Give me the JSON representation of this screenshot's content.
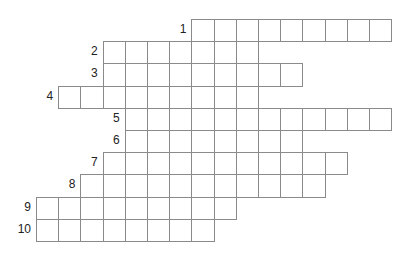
{
  "puzzle": {
    "type": "crossword",
    "cell_size": 22.2,
    "origin_x": 37,
    "origin_y": 20,
    "rows": [
      {
        "number": "1",
        "start_col": 7,
        "length": 9
      },
      {
        "number": "2",
        "start_col": 3,
        "length": 7
      },
      {
        "number": "3",
        "start_col": 3,
        "length": 9
      },
      {
        "number": "4",
        "start_col": 1,
        "length": 9
      },
      {
        "number": "5",
        "start_col": 4,
        "length": 12
      },
      {
        "number": "6",
        "start_col": 4,
        "length": 8
      },
      {
        "number": "7",
        "start_col": 3,
        "length": 11
      },
      {
        "number": "8",
        "start_col": 2,
        "length": 11
      },
      {
        "number": "9",
        "start_col": 0,
        "length": 9
      },
      {
        "number": "10",
        "start_col": 0,
        "length": 8
      }
    ],
    "colors": {
      "line": "#8a8a8a",
      "cell_bg": "#ffffff",
      "number": "#222222"
    }
  }
}
